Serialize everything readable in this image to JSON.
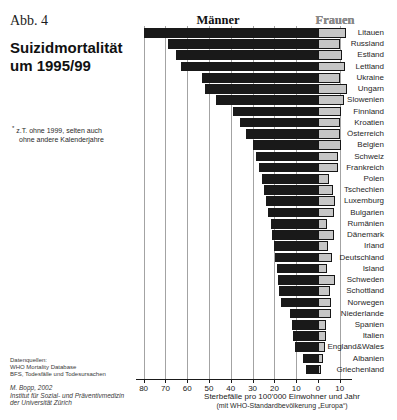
{
  "figure_label": "Abb. 4",
  "title": {
    "line1": "Suizidmortalität",
    "line2": "um 1995/99"
  },
  "footnote": {
    "marker": "*",
    "line1": "z.T. ohne 1999, selten auch",
    "line2": "ohne andere Kalenderjahre"
  },
  "sources": {
    "heading": "Datenquellen:",
    "lines": [
      "WHO Mortality Database",
      "BFS, Todesfälle und Todesursachen"
    ]
  },
  "credit": {
    "lines": [
      "M. Bopp, 2002",
      "Institut für Sozial- und Präventivmedizin",
      "der Universität Zürich"
    ]
  },
  "chart_data": {
    "type": "bar",
    "orientation": "horizontal-diverging",
    "title": "Suizidmortalität um 1995/99",
    "left_header": "Männer",
    "right_header": "Frauen",
    "xlabel": "Sterbefälle pro 100'000 Einwohner und Jahr",
    "xlabel_sub": "(mit WHO-Standardbevölkerung „Europa“)",
    "xlim_left": 80,
    "xlim_right": 15,
    "grid": true,
    "ticks_left": [
      80,
      70,
      60,
      50,
      40,
      30,
      20,
      10
    ],
    "tick_zero": 0,
    "ticks_right": [
      10
    ],
    "categories": [
      "Litauen",
      "Russland",
      "Estland",
      "Lettland",
      "Ukraine",
      "Ungarn",
      "Slowenien",
      "Finnland",
      "Kroatien",
      "Österreich",
      "Belgien",
      "Schweiz",
      "Frankreich",
      "Polen",
      "Tschechien",
      "Luxemburg",
      "Bulgarien",
      "Rumänien",
      "Dänemark",
      "Irland",
      "Deutschland",
      "Island",
      "Schweden",
      "Schottland",
      "Norwegen",
      "Niederlande",
      "Spanien",
      "Italien",
      "England&Wales",
      "Albanien",
      "Griechenland"
    ],
    "series": [
      {
        "name": "Männer",
        "side": "left",
        "values": [
          80,
          69,
          65,
          63,
          53,
          52,
          47,
          39,
          36,
          33,
          30,
          28.5,
          27,
          25.5,
          25,
          24,
          23,
          21.5,
          21,
          20,
          19.5,
          19,
          18.5,
          18,
          17,
          13,
          12,
          11.5,
          10.5,
          7,
          5.5
        ]
      },
      {
        "name": "Frauen",
        "side": "right",
        "values": [
          13,
          10,
          11,
          12.5,
          10,
          13.3,
          12,
          10.5,
          10,
          10,
          10.5,
          9,
          9,
          5,
          7,
          8,
          7.5,
          4,
          7.5,
          4.5,
          6.5,
          4,
          8,
          5.5,
          6,
          6,
          3.5,
          3.5,
          3,
          2.5,
          1.2
        ]
      }
    ],
    "colors": {
      "male_bar": "#191919",
      "female_bar": "#c6c6c6",
      "female_border": "#161616",
      "gridline": "#a3a3a3",
      "axis": "#1a1a1a"
    }
  }
}
